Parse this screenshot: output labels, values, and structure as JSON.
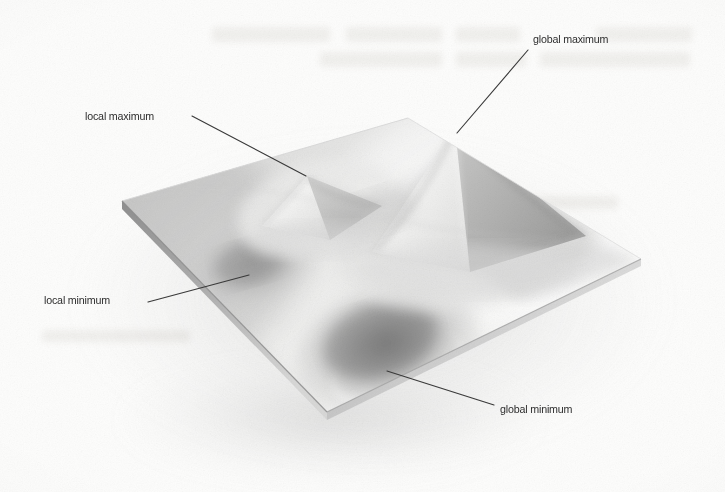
{
  "figure": {
    "kind": "scanned-textbook-illustration",
    "background_color": "#fdfdfc",
    "ink_color": "#2e2e2e",
    "leader_line_color": "#3a3a3a",
    "surface_light": "#fbfbfa",
    "surface_shadow": "#8e8e8e"
  },
  "annotations": [
    {
      "id": "global-maximum",
      "label": "global maximum",
      "label_x": 533,
      "label_y": 40,
      "anchor": "left",
      "leader": {
        "x1": 528,
        "y1": 50,
        "x2": 457,
        "y2": 133
      }
    },
    {
      "id": "local-maximum",
      "label": "local maximum",
      "label_x": 85,
      "label_y": 117,
      "anchor": "left",
      "leader": {
        "x1": 192,
        "y1": 116,
        "x2": 306,
        "y2": 176
      }
    },
    {
      "id": "local-minimum",
      "label": "local minimum",
      "label_x": 44,
      "label_y": 301,
      "anchor": "left",
      "leader": {
        "x1": 148,
        "y1": 302,
        "x2": 249,
        "y2": 275
      }
    },
    {
      "id": "global-minimum",
      "label": "global minimum",
      "label_x": 500,
      "label_y": 410,
      "anchor": "left",
      "leader": {
        "x1": 387,
        "y1": 371,
        "x2": 494,
        "y2": 405
      }
    }
  ],
  "surface": {
    "corners": {
      "left": {
        "x": 122,
        "y": 201
      },
      "top": {
        "x": 408,
        "y": 118
      },
      "right": {
        "x": 641,
        "y": 259
      },
      "bottom": {
        "x": 327,
        "y": 412
      }
    },
    "features": [
      {
        "id": "global-maximum-peak",
        "x": 455,
        "y": 130,
        "type": "peak",
        "relative_height": 1.0
      },
      {
        "id": "local-maximum-peak",
        "x": 307,
        "y": 178,
        "type": "peak",
        "relative_height": 0.45
      },
      {
        "id": "local-minimum-basin",
        "x": 252,
        "y": 272,
        "type": "basin",
        "relative_depth": 0.45
      },
      {
        "id": "global-minimum-basin",
        "x": 388,
        "y": 350,
        "type": "basin",
        "relative_depth": 1.0
      }
    ]
  },
  "ghost_text": {
    "note": "faint bleed-through from reverse side of page",
    "lines": [
      {
        "x": 210,
        "y": 34,
        "width": 480,
        "height": 17
      },
      {
        "x": 318,
        "y": 58,
        "width": 372,
        "height": 17
      },
      {
        "x": 222,
        "y": 186,
        "width": 300,
        "height": 14
      },
      {
        "x": 430,
        "y": 200,
        "width": 190,
        "height": 14
      },
      {
        "x": 40,
        "y": 332,
        "width": 150,
        "height": 13
      }
    ]
  }
}
